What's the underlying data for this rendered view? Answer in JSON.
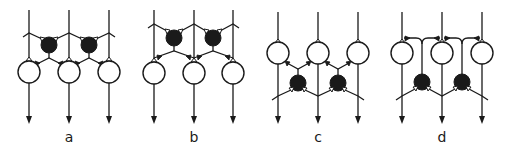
{
  "figure": {
    "panels": [
      {
        "id": "a",
        "label": "a",
        "description": "Inhibitory interneurons (filled) above principal cells (open), feedforward from input fibers"
      },
      {
        "id": "b",
        "label": "b",
        "description": "Inhibitory interneurons above principal cells, output to principal cell inputs"
      },
      {
        "id": "c",
        "label": "c",
        "description": "Principal cells above, inhibitory interneurons below receiving from collaterals"
      },
      {
        "id": "d",
        "label": "d",
        "description": "Principal cells with recurrent collaterals looping to top; interneurons below"
      }
    ],
    "colors": {
      "stroke": "#1a1a1a",
      "background": "#ffffff",
      "filled_cell": "#1a1a1a",
      "open_cell": "#ffffff"
    }
  }
}
